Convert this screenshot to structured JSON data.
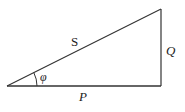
{
  "diagram": {
    "type": "power-triangle",
    "vertices": {
      "origin": [
        7,
        86
      ],
      "right_angle": [
        161,
        86
      ],
      "top": [
        161,
        9
      ]
    },
    "labels": {
      "hypotenuse": "S",
      "vertical": "Q",
      "horizontal": "P",
      "angle": "φ"
    },
    "colors": {
      "line": "#333333",
      "background": "#ffffff"
    }
  }
}
